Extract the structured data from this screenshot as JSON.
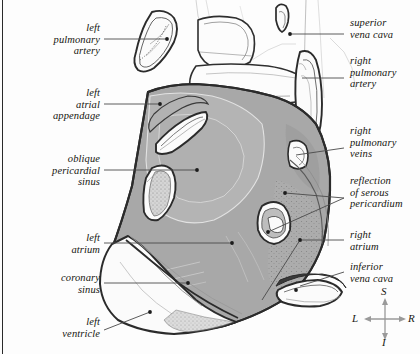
{
  "figure": {
    "colors": {
      "page_background": "#fdfdfd",
      "body_fill": "#a8a8a8",
      "body_fill_light": "#b6b6b6",
      "ventricle_fill": "#fbfbfb",
      "outline": "#2b2b2b",
      "leader_line": "#4a4a4a",
      "compass_arrow": "#9a9a9a",
      "edge_rule": "#2a2a2a"
    }
  },
  "labels_left": [
    {
      "id": "left-pulmonary-artery",
      "text": "left\npulmonary\nartery",
      "lines": 3
    },
    {
      "id": "left-atrial-appendage",
      "text": "left\natrial\nappendage",
      "lines": 3
    },
    {
      "id": "oblique-pericardial-sinus",
      "text": "oblique\npericardial\nsinus",
      "lines": 3
    },
    {
      "id": "left-atrium",
      "text": "left\natrium",
      "lines": 2
    },
    {
      "id": "coronary-sinus",
      "text": "coronary\nsinus",
      "lines": 2
    },
    {
      "id": "left-ventricle",
      "text": "left\nventricle",
      "lines": 2
    }
  ],
  "labels_right": [
    {
      "id": "superior-vena-cava",
      "text": "superior\nvena cava",
      "lines": 2
    },
    {
      "id": "right-pulmonary-artery",
      "text": "right\npulmonary\nartery",
      "lines": 3
    },
    {
      "id": "right-pulmonary-veins",
      "text": "right\npulmonary\nveins",
      "lines": 3
    },
    {
      "id": "reflection-of-serous-pericardium",
      "text": "reflection\nof serous\npericardium",
      "lines": 3
    },
    {
      "id": "right-atrium",
      "text": "right\natrium",
      "lines": 2
    },
    {
      "id": "inferior-vena-cava",
      "text": "inferior\nvena cava",
      "lines": 2
    }
  ],
  "orientation_compass": {
    "superior": "S",
    "inferior": "I",
    "left": "L",
    "right": "R"
  }
}
